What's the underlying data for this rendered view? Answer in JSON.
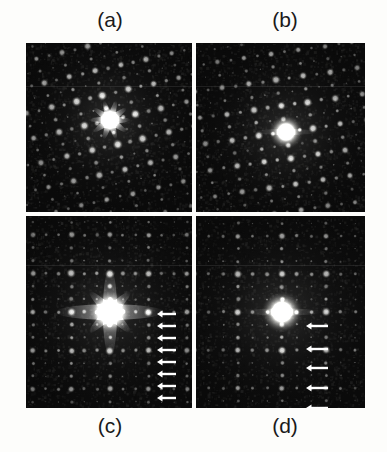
{
  "figure": {
    "caption_labels": [
      "(a)",
      "(b)",
      "(c)",
      "(d)"
    ],
    "background_color": "#fdfdfb",
    "panel_background_color": "#0b0b0b",
    "spot_color": "#ffffff",
    "divider_color": "#e8e8e4",
    "arrow_color": "#ffffff"
  },
  "labels": {
    "a": "(a)",
    "b": "(b)",
    "c": "(c)",
    "d": "(d)"
  },
  "panels": [
    {
      "id": "a",
      "label": "(a)",
      "kind": "electron-diffraction-pattern",
      "x": 26,
      "y": 43,
      "width": 166,
      "height": 169,
      "center": [
        84,
        77
      ],
      "central_spot_radius": 13,
      "central_spot_style": "starburst",
      "lattice": {
        "type": "oblique-quasiperiodic",
        "a_vector": [
          25.5,
          -6.0
        ],
        "b_vector": [
          7.5,
          24.5
        ],
        "sub_divisions": 2,
        "range_i": [
          -5,
          5
        ],
        "range_j": [
          -5,
          5
        ]
      },
      "spot_count_estimate": 240,
      "arrows": []
    },
    {
      "id": "b",
      "label": "(b)",
      "kind": "electron-diffraction-pattern",
      "x": 196,
      "y": 43,
      "width": 169,
      "height": 169,
      "center": [
        90,
        89
      ],
      "central_spot_radius": 15,
      "central_spot_style": "round-bright",
      "lattice": {
        "type": "oblique-quasiperiodic",
        "a_vector": [
          27.0,
          -4.0
        ],
        "b_vector": [
          5.0,
          26.0
        ],
        "sub_divisions": 2,
        "range_i": [
          -5,
          5
        ],
        "range_j": [
          -5,
          5
        ]
      },
      "spot_count_estimate": 200,
      "arrows": []
    },
    {
      "id": "c",
      "label": "(c)",
      "kind": "electron-diffraction-pattern",
      "x": 26,
      "y": 216,
      "width": 166,
      "height": 192,
      "center": [
        84,
        96
      ],
      "central_spot_radius": 17,
      "central_spot_style": "diamond-streak",
      "lattice": {
        "type": "square-superlattice",
        "a_vector": [
          38.5,
          0.0
        ],
        "b_vector": [
          0.0,
          38.5
        ],
        "sub_divisions": 3,
        "range_i": [
          -3,
          3
        ],
        "range_j": [
          -3,
          3
        ]
      },
      "spot_count_estimate": 340,
      "arrows": {
        "count": 8,
        "direction": "left",
        "tip_x": 131,
        "length": 19,
        "y_positions": [
          98,
          110,
          122,
          134,
          146,
          158,
          170,
          182
        ]
      }
    },
    {
      "id": "d",
      "label": "(d)",
      "kind": "electron-diffraction-pattern",
      "x": 196,
      "y": 216,
      "width": 169,
      "height": 192,
      "center": [
        86,
        96
      ],
      "central_spot_radius": 18,
      "central_spot_style": "round-bright",
      "lattice": {
        "type": "rectangular-superlattice",
        "a_vector": [
          44.0,
          0.0
        ],
        "b_vector": [
          0.0,
          38.0
        ],
        "sub_divisions": 3,
        "range_i": [
          -3,
          3
        ],
        "range_j": [
          -3,
          3
        ]
      },
      "spot_count_estimate": 210,
      "arrows": {
        "count": 6,
        "direction": "left",
        "tip_x": 110,
        "length": 22,
        "y_positions": [
          110,
          133,
          152,
          172,
          192,
          205
        ]
      }
    }
  ],
  "chart_data": {
    "type": "scatter",
    "title": "",
    "panel_ids": [
      "a",
      "b",
      "c",
      "d"
    ],
    "marked_rows_panel_c": 8,
    "marked_rows_panel_d": 6
  }
}
